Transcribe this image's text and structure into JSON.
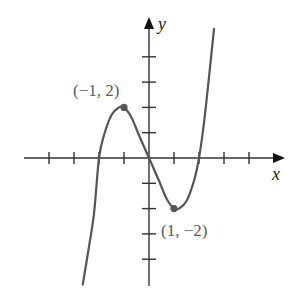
{
  "chart_data": {
    "type": "line",
    "title": "",
    "xlabel": "x",
    "ylabel": "y",
    "xlim": [
      -4,
      5
    ],
    "ylim": [
      -5,
      5
    ],
    "grid": false,
    "x_ticks": [
      -4,
      -3,
      -2,
      -1,
      1,
      2,
      3,
      4
    ],
    "y_ticks": [
      -4,
      -3,
      -2,
      -1,
      1,
      2,
      3,
      4
    ],
    "tick_labels_shown": false,
    "series": [
      {
        "name": "cubic curve",
        "color": "#555555",
        "x": [
          -2.65,
          -2.4,
          -2.2,
          -2.0,
          -1.8,
          -1.5,
          -1.2,
          -1.0,
          -0.7,
          -0.4,
          0.0,
          0.4,
          0.7,
          1.0,
          1.2,
          1.5,
          1.8,
          2.0,
          2.2,
          2.4,
          2.6
        ],
        "y": [
          -5.0,
          -3.5,
          -2.2,
          0.0,
          0.9,
          1.7,
          2.0,
          2.0,
          1.6,
          0.9,
          0.0,
          -0.9,
          -1.6,
          -2.0,
          -2.0,
          -1.7,
          -0.9,
          0.0,
          1.4,
          3.2,
          5.1
        ]
      }
    ],
    "points": [
      {
        "x": -1,
        "y": 2,
        "label": "(−1, 2)"
      },
      {
        "x": 1,
        "y": -2,
        "label": "(1, −2)"
      }
    ],
    "annotations": [
      "(−1, 2)",
      "(1, −2)"
    ]
  },
  "labels": {
    "x_axis": "x",
    "y_axis": "y",
    "point_max": "(−1, 2)",
    "point_min": "(1, −2)"
  }
}
